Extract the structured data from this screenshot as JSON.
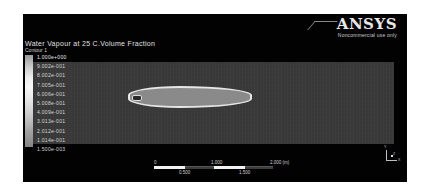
{
  "logo": {
    "brand": "ANSYS",
    "subtitle": "Noncommercial use only"
  },
  "plot": {
    "title": "Water Vapour at 25 C.Volume Fraction",
    "subtitle": "Contour 1"
  },
  "legend": {
    "labels": [
      "1.000e+000",
      "9.002e-001",
      "8.002e-001",
      "7.005e-001",
      "6.006e-001",
      "5.008e-001",
      "4.009e-001",
      "3.013e-001",
      "2.012e-001",
      "1.014e-001",
      "1.500e-003"
    ]
  },
  "scale_bar": {
    "top_labels": [
      "0",
      "1.000",
      "2.000 (m)"
    ],
    "bottom_labels": [
      "0.500",
      "1.500"
    ]
  },
  "triad": {
    "y_label": "Y",
    "x_label": "X",
    "z_label": "Z"
  }
}
